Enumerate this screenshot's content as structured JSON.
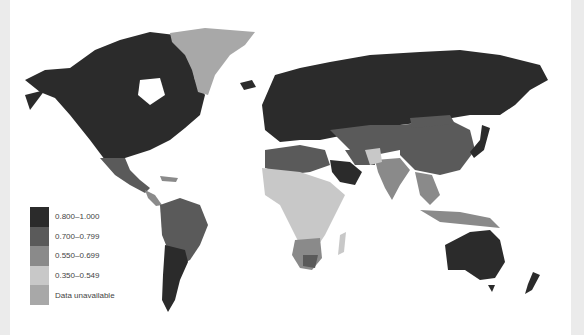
{
  "map": {
    "type": "choropleth-world",
    "background": "#ffffff",
    "colors": {
      "c0800_1000": "#2b2b2b",
      "c0700_0799": "#5a5a5a",
      "c0550_0699": "#8a8a8a",
      "c0350_0549": "#c8c8c8",
      "unavailable": "#a8a8a8"
    }
  },
  "legend": {
    "items": [
      {
        "label": "0.800–1.000",
        "color": "#2b2b2b"
      },
      {
        "label": "0.700–0.799",
        "color": "#5a5a5a"
      },
      {
        "label": "0.550–0.699",
        "color": "#8a8a8a"
      },
      {
        "label": "0.350–0.549",
        "color": "#c8c8c8"
      },
      {
        "label": "Data unavailable",
        "color": "#a8a8a8"
      }
    ]
  }
}
